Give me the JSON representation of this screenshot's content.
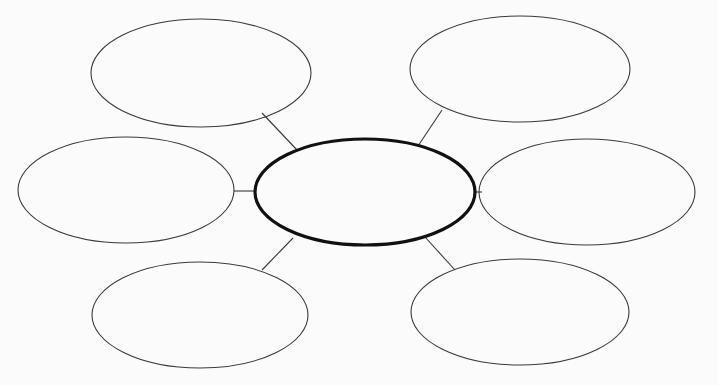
{
  "diagram": {
    "type": "graphic-organizer-web",
    "background": "#fbfbfb",
    "center": {
      "label": "",
      "cx": 365,
      "cy": 192,
      "rx": 110,
      "ry": 53
    },
    "bubbles": [
      {
        "id": "top-left",
        "label": "",
        "cx": 201,
        "cy": 73,
        "rx": 110,
        "ry": 54,
        "line": [
          262,
          113,
          297,
          150
        ]
      },
      {
        "id": "top-right",
        "label": "",
        "cx": 520,
        "cy": 69,
        "rx": 110,
        "ry": 53,
        "line": [
          442,
          110,
          418,
          146
        ]
      },
      {
        "id": "middle-left",
        "label": "",
        "cx": 126,
        "cy": 190,
        "rx": 108,
        "ry": 53,
        "line": [
          234,
          191,
          255,
          191
        ]
      },
      {
        "id": "middle-right",
        "label": "",
        "cx": 587,
        "cy": 192,
        "rx": 108,
        "ry": 53,
        "line": [
          475,
          192,
          482,
          192
        ]
      },
      {
        "id": "bottom-left",
        "label": "",
        "cx": 200,
        "cy": 315,
        "rx": 108,
        "ry": 53,
        "line": [
          262,
          270,
          293,
          238
        ]
      },
      {
        "id": "bottom-right",
        "label": "",
        "cx": 520,
        "cy": 312,
        "rx": 109,
        "ry": 53,
        "line": [
          455,
          270,
          425,
          237
        ]
      }
    ]
  }
}
